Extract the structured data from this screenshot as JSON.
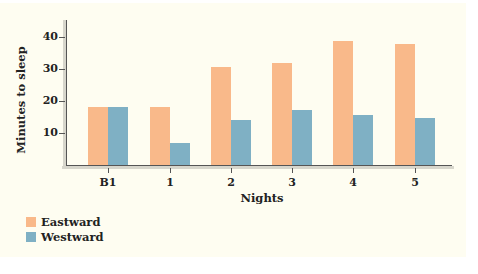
{
  "chart_data": {
    "type": "bar",
    "title": "",
    "xlabel": "Nights",
    "ylabel": "Minutes to sleep",
    "categories": [
      "B1",
      "1",
      "2",
      "3",
      "4",
      "5"
    ],
    "series": [
      {
        "name": "Eastward",
        "color": "#f9b98a",
        "values": [
          18,
          18,
          30.5,
          32,
          38.8,
          37.8
        ]
      },
      {
        "name": "Westward",
        "color": "#7fb0c4",
        "values": [
          18,
          7,
          14,
          17.2,
          15.5,
          14.7
        ]
      }
    ],
    "yticks": [
      10,
      20,
      30,
      40
    ],
    "ylim": [
      0,
      45
    ],
    "grid": false,
    "legend_position": "bottom-left"
  },
  "axis": {
    "ylabel": "Minutes to sleep",
    "xlabel": "Nights",
    "yticks": [
      "10",
      "20",
      "30",
      "40"
    ],
    "xticks": [
      "B1",
      "1",
      "2",
      "3",
      "4",
      "5"
    ]
  },
  "legend": [
    {
      "label": "Eastward",
      "color": "#f9b98a"
    },
    {
      "label": "Westward",
      "color": "#7fb0c4"
    }
  ]
}
